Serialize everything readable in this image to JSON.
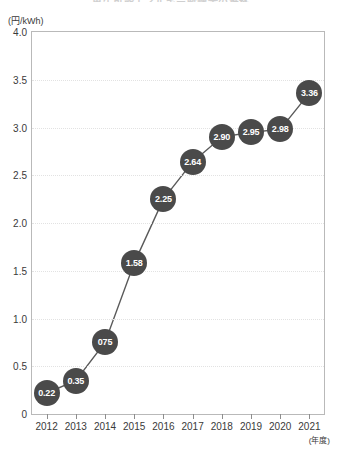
{
  "chart_title": "再生可能エネルギー賦課金の推移",
  "y_axis_unit": "(円/kWh)",
  "x_axis_note": "(年度)",
  "colors": {
    "marker": "#4a4a4a",
    "marker_text": "#ffffff",
    "line": "#5a5a5a",
    "grid": "#e2e2e2",
    "frame": "#b9b9b9",
    "text": "#3a3a3a"
  },
  "chart_data": {
    "type": "line",
    "title": "再生可能エネルギー賦課金の推移",
    "xlabel": "(年度)",
    "ylabel": "(円/kWh)",
    "categories": [
      "2012",
      "2013",
      "2014",
      "2015",
      "2016",
      "2017",
      "2018",
      "2019",
      "2020",
      "2021"
    ],
    "values": [
      0.22,
      0.35,
      0.75,
      1.58,
      2.25,
      2.64,
      2.9,
      2.95,
      2.98,
      3.36
    ],
    "point_labels": [
      "0.22",
      "0.35",
      "075",
      "1.58",
      "2.25",
      "2.64",
      "2.90",
      "2.95",
      "2.98",
      "3.36"
    ],
    "ylim": [
      0,
      4.0
    ],
    "ytick_labels": [
      "4.0",
      "3.5",
      "3.0",
      "2.5",
      "2.0",
      "1.5",
      "1.0",
      "0.5",
      "0"
    ],
    "ytick_values": [
      4.0,
      3.5,
      3.0,
      2.5,
      2.0,
      1.5,
      1.0,
      0.5,
      0
    ],
    "grid": true,
    "legend": false
  }
}
